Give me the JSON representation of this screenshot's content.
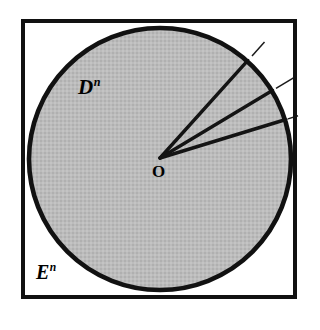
{
  "figure": {
    "kind": "geometric-diagram",
    "caption_absent": true,
    "background_color": "#ffffff",
    "square": {
      "name": "euclidean-space-boundary",
      "label": "E",
      "label_superscript": "n",
      "x": 23,
      "y": 21,
      "width": 272,
      "height": 276,
      "stroke_color": "#111111",
      "stroke_width": 4,
      "fill": "none"
    },
    "circle": {
      "name": "unit-disk",
      "label": "D",
      "label_superscript": "n",
      "center_x": 160,
      "center_y": 159,
      "radius": 133,
      "stroke_color": "#111111",
      "stroke_width": 5,
      "fill_color": "#b9b9b9"
    },
    "origin": {
      "name": "origin-point",
      "label": "O",
      "x": 160,
      "y": 158
    },
    "rays": [
      {
        "name": "ray-1",
        "angle_degrees": -48,
        "inner_stroke_width": 3.2,
        "outer_stroke_width": 1.4,
        "exits_through": "top-edge"
      },
      {
        "name": "ray-2",
        "angle_degrees": -31,
        "inner_stroke_width": 3.2,
        "outer_stroke_width": 1.4,
        "exits_through": "right-edge"
      },
      {
        "name": "ray-3",
        "angle_degrees": -17,
        "inner_stroke_width": 3.2,
        "outer_stroke_width": 1.4,
        "exits_through": "right-edge"
      }
    ],
    "colors": {
      "ink": "#111111",
      "disk_fill": "#b9b9b9",
      "page": "#ffffff"
    }
  }
}
